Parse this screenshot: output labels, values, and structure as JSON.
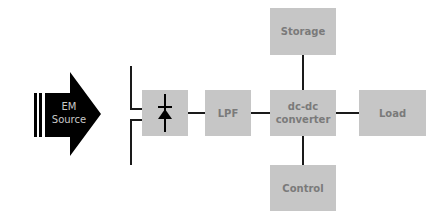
{
  "diagram": {
    "source": {
      "line1": "EM",
      "line2": "Source"
    },
    "blocks": {
      "rectifier": {
        "icon": "diode-icon"
      },
      "lpf": {
        "label": "LPF"
      },
      "converter": {
        "line1": "dc-dc",
        "line2": "converter"
      },
      "storage": {
        "label": "Storage"
      },
      "load": {
        "label": "Load"
      },
      "control": {
        "label": "Control"
      }
    },
    "colors": {
      "block": "#c6c6c6",
      "text": "#7a7a7a",
      "line": "#1a1a1a",
      "arrow": "#000000"
    }
  }
}
